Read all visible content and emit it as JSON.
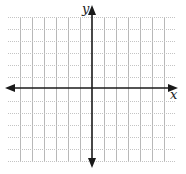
{
  "diagram": {
    "type": "coordinate-plane",
    "x_axis_label": "x",
    "y_axis_label": "y",
    "grid": {
      "vertical_lines_x": [
        20,
        32,
        44,
        56,
        68,
        80,
        104,
        116,
        128,
        140,
        152,
        164
      ],
      "horizontal_lines_y": [
        17,
        29,
        41,
        53,
        65,
        77,
        101,
        113,
        125,
        137,
        149,
        161
      ],
      "grid_left": 20,
      "grid_right": 164,
      "grid_top": 17,
      "grid_bottom": 161,
      "dotted_x_extent": [
        8,
        176
      ],
      "color": "#b8b8b8",
      "dotted_color": "#c4c4c4"
    },
    "axes": {
      "origin_x": 92,
      "origin_y": 88,
      "x_start": 5,
      "x_end": 178,
      "y_start": 5,
      "y_end": 168,
      "color": "#1a1a1a"
    }
  }
}
